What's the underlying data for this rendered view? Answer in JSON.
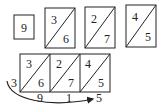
{
  "top_boxes": [
    {
      "type": "single",
      "value": "9"
    },
    {
      "type": "split",
      "upper": "3",
      "lower": "6"
    },
    {
      "type": "split",
      "upper": "2",
      "lower": "7"
    },
    {
      "type": "split",
      "upper": "4",
      "lower": "5"
    }
  ],
  "lattice": {
    "cells": [
      {
        "upper": "3",
        "lower": "6"
      },
      {
        "upper": "2",
        "lower": "7"
      },
      {
        "upper": "4",
        "lower": "5"
      }
    ],
    "left_digit": "3",
    "bottom_digits": [
      "9",
      "1",
      "5"
    ]
  },
  "colors": {
    "ink": "#222222",
    "background": "#ffffff"
  }
}
